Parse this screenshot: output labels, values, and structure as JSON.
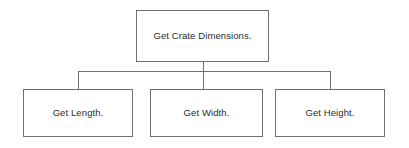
{
  "diagram": {
    "type": "structure-chart",
    "background_color": "#ffffff",
    "line_color": "#6f6f6f",
    "text_color": "#2b2b2b",
    "root": {
      "label": "Get Crate Dimensions."
    },
    "children": [
      {
        "label": "Get Length."
      },
      {
        "label": "Get Width."
      },
      {
        "label": "Get Height."
      }
    ]
  }
}
